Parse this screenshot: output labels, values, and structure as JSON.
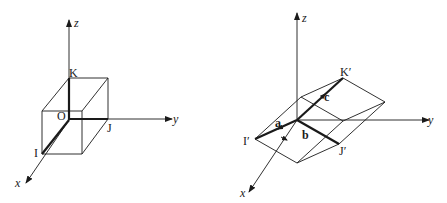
{
  "figure_left": {
    "title": "Unit cube in Cartesian axes",
    "axes": {
      "x": "x",
      "y": "y",
      "z": "z"
    },
    "points": {
      "origin": "O",
      "i": "I",
      "j": "J",
      "k": "K"
    }
  },
  "figure_right": {
    "title": "Parallelepiped spanned by lattice vectors",
    "axes": {
      "x": "x",
      "y": "y",
      "z": "z"
    },
    "points": {
      "i": "I′",
      "j": "J′",
      "k": "K′"
    },
    "vectors": {
      "a": "a",
      "b": "b",
      "c": "c"
    }
  },
  "colors": {
    "line": "#1a1a1a",
    "background": "#ffffff"
  }
}
